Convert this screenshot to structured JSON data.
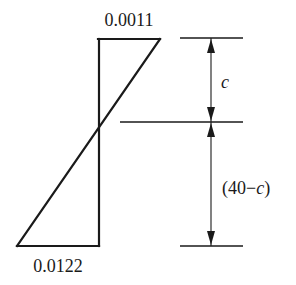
{
  "diagram": {
    "type": "strain-distribution",
    "labels": {
      "top_strain": "0.0011",
      "bottom_strain": "0.0122",
      "upper_dimension": "c",
      "lower_dimension_open": "(40",
      "lower_dimension_minus": "−",
      "lower_dimension_var": "c",
      "lower_dimension_close": ")"
    },
    "colors": {
      "line": "#1a1a1a",
      "background": "#ffffff"
    }
  }
}
